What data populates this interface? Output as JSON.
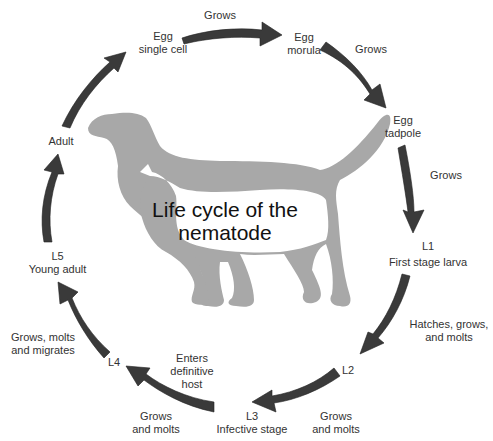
{
  "title": {
    "line1": "Life cycle of the",
    "line2": "nematode"
  },
  "stages": [
    {
      "id": "egg-single-cell",
      "line1": "Egg",
      "line2": "single cell"
    },
    {
      "id": "egg-morula",
      "line1": "Egg",
      "line2": "morula"
    },
    {
      "id": "egg-tadpole",
      "line1": "Egg",
      "line2": "tadpole"
    },
    {
      "id": "l1",
      "line1": "L1",
      "line2": "First stage larva"
    },
    {
      "id": "l2",
      "line1": "L2"
    },
    {
      "id": "l3",
      "line1": "L3",
      "line2": "Infective stage"
    },
    {
      "id": "l4",
      "line1": "L4"
    },
    {
      "id": "l5",
      "line1": "L5",
      "line2": "Young adult"
    },
    {
      "id": "adult",
      "line1": "Adult"
    }
  ],
  "transitions": [
    {
      "from": "egg-single-cell",
      "to": "egg-morula",
      "line1": "Grows"
    },
    {
      "from": "egg-morula",
      "to": "egg-tadpole",
      "line1": "Grows"
    },
    {
      "from": "egg-tadpole",
      "to": "l1",
      "line1": "Grows"
    },
    {
      "from": "l1",
      "to": "l2",
      "line1": "Hatches, grows,",
      "line2": "and molts"
    },
    {
      "from": "l2",
      "to": "l3",
      "line1": "Grows",
      "line2": "and molts"
    },
    {
      "from": "l3",
      "to": "l4",
      "line1": "Grows",
      "line2": "and molts"
    },
    {
      "from": "l4",
      "to": "l5",
      "line1": "Grows, molts",
      "line2": "and migrates"
    },
    {
      "from": "l5",
      "to": "adult",
      "line1": ""
    },
    {
      "from": "adult",
      "to": "egg-single-cell",
      "line1": ""
    }
  ],
  "annotations": {
    "enters_host": {
      "line1": "Enters",
      "line2": "definitive",
      "line3": "host"
    }
  },
  "colors": {
    "arrow": "#3a3a3a",
    "silhouette": "#a8a8a8",
    "text": "#333333"
  }
}
